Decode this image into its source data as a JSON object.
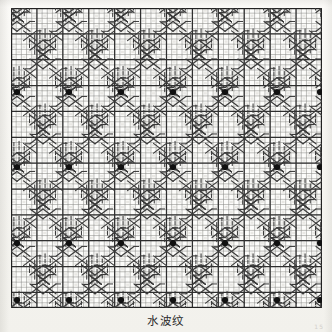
{
  "document": {
    "type": "knitting-stitch-chart",
    "caption": "水波纹",
    "page_mark": "15",
    "background_color": "#f7f6f2",
    "chart_background": "#fdfdfb",
    "ink_color": "#3a3a3a",
    "dot_color": "#111111"
  },
  "chart_data": {
    "type": "heatmap",
    "title": "水波纹",
    "xlabel": "",
    "ylabel": "",
    "grid": true,
    "legend": "none",
    "columns": 60,
    "rows": 58,
    "cell_width": 5.183,
    "cell_height": 5.172,
    "bold_every": 5,
    "origin_x": 11,
    "origin_y": 8,
    "symbols": [
      {
        "code": "knit",
        "name": "vertical-bar",
        "glyph": "|"
      },
      {
        "code": "cross-right",
        "name": "cable-cross-right",
        "glyph": "\\"
      },
      {
        "code": "cross-left",
        "name": "cable-cross-left",
        "glyph": "/"
      },
      {
        "code": "crossing",
        "name": "cable-crossing-x",
        "glyph": "X"
      },
      {
        "code": "bobble",
        "name": "filled-dot",
        "glyph": "●"
      }
    ],
    "motif": {
      "name": "water-ripple-lattice",
      "repeat_x": 52,
      "repeat_y": 75,
      "description": "Diagonal cable chains forming a diamond wave lattice with vertical knit bars filling the diamond interiors and bobbles at the lattice nodes."
    },
    "dots": {
      "x": [
        17,
        69,
        121,
        173,
        225,
        277,
        320
      ],
      "y": [
        92,
        167,
        243,
        300
      ]
    },
    "lattice_nodes_x": [
      17,
      69,
      121,
      173,
      225,
      277,
      320
    ],
    "lattice_nodes_y": [
      17,
      55,
      92,
      130,
      167,
      205,
      243,
      281
    ],
    "values": []
  }
}
